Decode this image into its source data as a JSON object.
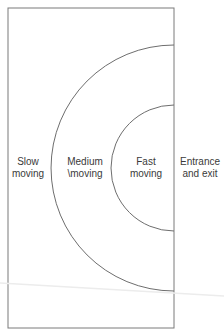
{
  "diagram": {
    "type": "warehouse-zoning-layout",
    "colors": {
      "line": "#7a7a7a",
      "text": "#3a3a3a",
      "background": "#ffffff"
    },
    "zones": [
      {
        "id": "slow",
        "line1": "Slow",
        "line2": "moving"
      },
      {
        "id": "medium",
        "line1": "Medium",
        "line2": "\\moving"
      },
      {
        "id": "fast",
        "line1": "Fast",
        "line2": "moving"
      },
      {
        "id": "entrance",
        "line1": "Entrance",
        "line2": "and exit"
      }
    ]
  }
}
